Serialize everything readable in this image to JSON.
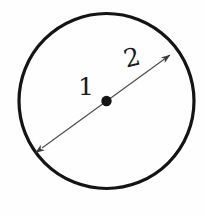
{
  "figure": {
    "kind": "geometry-diagram",
    "background_color": "#fefefe",
    "ink_color": "#1a1a1a",
    "line_color": "#3a3a3a"
  },
  "labels": {
    "center_point": "1",
    "radius_segment": "2"
  },
  "geometry": {
    "circle": {
      "center_x": 106.5,
      "center_y": 101,
      "radius": 87.5,
      "stroke_width": 3.2,
      "stroke_color": "#141414",
      "fill": "none"
    },
    "center_dot": {
      "center_x": 106.5,
      "center_y": 101,
      "radius": 5.2,
      "fill_color": "#141414"
    },
    "diameter_arrow": {
      "start_x": 42,
      "start_y": 148,
      "end_x": 170,
      "end_y": 55,
      "stroke_width": 1.1,
      "stroke_color": "#4a4a4a",
      "arrowhead_both_ends": true,
      "arrowhead_length": 9,
      "arrowhead_width": 4
    }
  }
}
